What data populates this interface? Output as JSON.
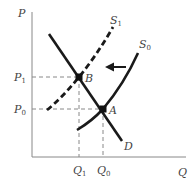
{
  "diagram": {
    "axes": {
      "y_label": "P",
      "x_label": "Q"
    },
    "price_levels": [
      {
        "id": "P1",
        "base": "P",
        "sub": "1"
      },
      {
        "id": "P0",
        "base": "P",
        "sub": "0"
      }
    ],
    "quantity_levels": [
      {
        "id": "Q1",
        "base": "Q",
        "sub": "1"
      },
      {
        "id": "Q0",
        "base": "Q",
        "sub": "0"
      }
    ],
    "curves": [
      {
        "id": "D",
        "label": "D",
        "style": "solid",
        "kind": "demand"
      },
      {
        "id": "S0",
        "label_base": "S",
        "label_sub": "0",
        "style": "solid",
        "kind": "supply-original"
      },
      {
        "id": "S1",
        "label_base": "S",
        "label_sub": "1",
        "style": "dashed",
        "kind": "supply-new"
      }
    ],
    "points": [
      {
        "id": "A",
        "label": "A",
        "on": [
          "D",
          "S0"
        ],
        "price": "P0",
        "quantity": "Q0"
      },
      {
        "id": "B",
        "label": "B",
        "on": [
          "D",
          "S1"
        ],
        "price": "P1",
        "quantity": "Q1"
      }
    ],
    "shift_arrow": {
      "direction": "left",
      "meaning": "supply decreases from S0 to S1"
    },
    "colors": {
      "curve": "#1a1a1a",
      "axis": "#888888",
      "guide": "#888888",
      "text": "#444444"
    }
  }
}
